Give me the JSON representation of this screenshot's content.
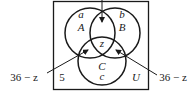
{
  "diagram": {
    "type": "venn",
    "universe": {
      "label": "U"
    },
    "sets": [
      {
        "name": "A",
        "region_label": "a"
      },
      {
        "name": "B",
        "region_label": "b"
      },
      {
        "name": "C",
        "region_label": "c"
      }
    ],
    "center_label": "z",
    "outside_value": "5",
    "annotations": {
      "left": "36 − z",
      "right": "36 − z"
    },
    "colors": {
      "stroke": "#1a1a1a",
      "background": "#ffffff"
    }
  }
}
